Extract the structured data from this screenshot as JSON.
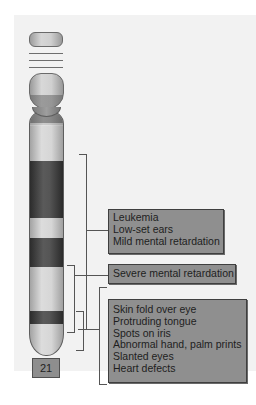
{
  "figure": {
    "chromosome_label": "21",
    "annotations": [
      {
        "id": "region-1",
        "traits": [
          "Leukemia",
          "Low-set ears",
          "Mild mental retardation"
        ]
      },
      {
        "id": "region-2",
        "traits": [
          "Severe mental retardation"
        ]
      },
      {
        "id": "region-3",
        "traits": [
          "Skin fold over eye",
          "Protruding tongue",
          "Spots on iris",
          "Abnormal hand, palm prints",
          "Slanted eyes",
          "Heart defects"
        ]
      }
    ],
    "colors": {
      "box_fill": "#8f8f8f",
      "box_border": "#3f3f3f",
      "dark_band": "#3a3a3a",
      "light_band": "#d6d6d6",
      "bracket_line": "#555555"
    }
  }
}
